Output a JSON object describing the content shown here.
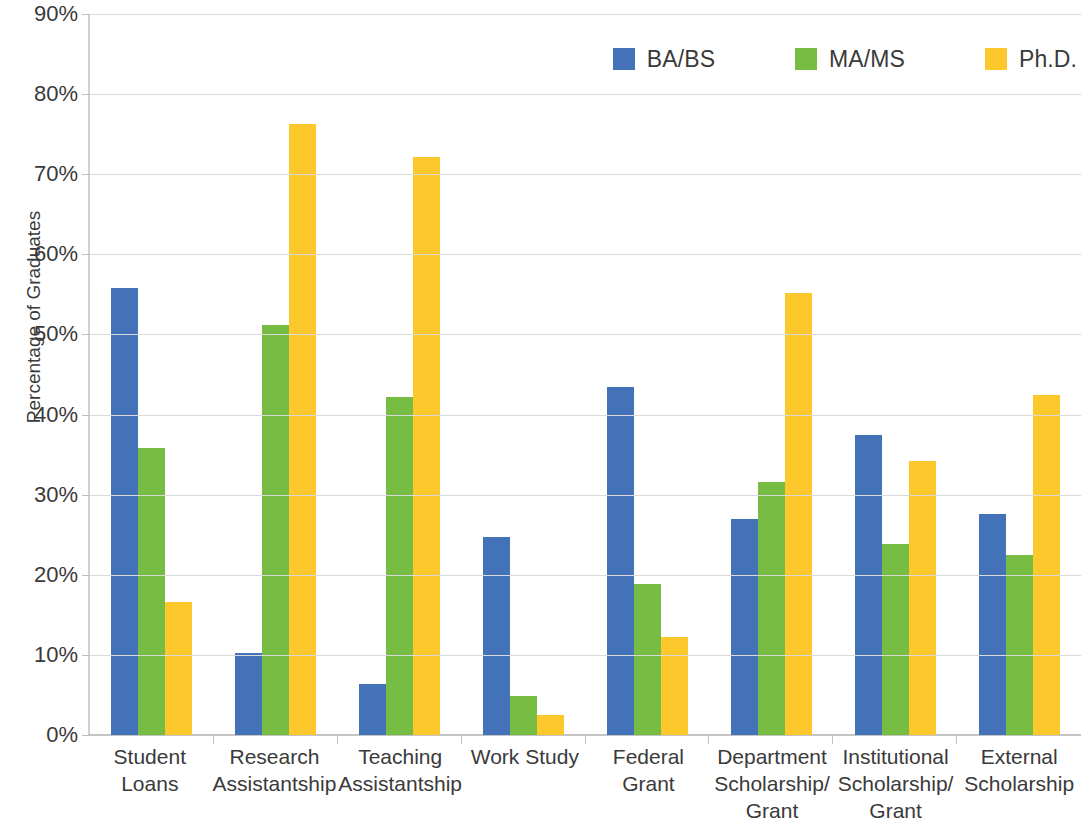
{
  "chart_data": {
    "type": "bar",
    "title": "",
    "subtitle": "",
    "xlabel": "",
    "ylabel": "Percentage of Graduates",
    "ylim": [
      0,
      90
    ],
    "ytick_values": [
      0,
      10,
      20,
      30,
      40,
      50,
      60,
      70,
      80,
      90
    ],
    "ytick_labels": [
      "0%",
      "10%",
      "20%",
      "30%",
      "40%",
      "50%",
      "60%",
      "70%",
      "80%",
      "90%"
    ],
    "grid": true,
    "legend_position": "top-right",
    "categories": [
      "Student Loans",
      "Research Assistantship",
      "Teaching Assistantship",
      "Work Study",
      "Federal Grant",
      "Department Scholarship/ Grant",
      "Institutional Scholarship/ Grant",
      "External Scholarship"
    ],
    "series": [
      {
        "name": "BA/BS",
        "color": "#4472B8",
        "values": [
          55.8,
          10.2,
          6.4,
          24.7,
          43.5,
          27.0,
          37.4,
          27.6
        ]
      },
      {
        "name": "MA/MS",
        "color": "#77BC43",
        "values": [
          35.8,
          51.2,
          42.2,
          4.9,
          18.9,
          31.6,
          23.9,
          22.5
        ]
      },
      {
        "name": "Ph.D.",
        "color": "#FDC82B",
        "values": [
          16.6,
          76.3,
          72.1,
          2.5,
          12.2,
          55.2,
          34.2,
          42.4
        ]
      }
    ]
  }
}
